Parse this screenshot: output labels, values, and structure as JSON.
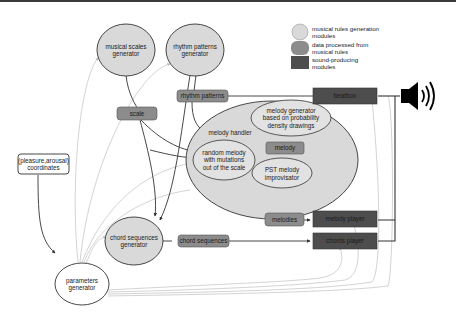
{
  "colors": {
    "module_fill": "#d9d9d9",
    "data_fill": "#8c8c8c",
    "sound_fill": "#4d4d4d",
    "stroke": "#333333",
    "faint_line": "#c8c8c8"
  },
  "legend": {
    "items": [
      {
        "label_line1": "musical rules generation",
        "label_line2": "modules",
        "swatch": "light-circle"
      },
      {
        "label_line1": "data processed from",
        "label_line2": "musical rules",
        "swatch": "medium-rounded"
      },
      {
        "label_line1": "sound-producing",
        "label_line2": "modules",
        "swatch": "dark-square"
      }
    ]
  },
  "nodes": {
    "musical_scales_generator": {
      "line1": "musical scales",
      "line2": "generator"
    },
    "rhythm_patterns_generator": {
      "line1": "rhythm patterns",
      "line2": "generator"
    },
    "scale": {
      "label": "scale"
    },
    "rhythm_patterns": {
      "label": "rhythm patterns"
    },
    "beatbox": {
      "label": "beatbox"
    },
    "melody_handler": {
      "label": "melody handler"
    },
    "melody_generator": {
      "line1": "melody generator",
      "line2": "based on probability",
      "line3": "density drawings"
    },
    "random_melody": {
      "line1": "random melody",
      "line2": "with mutations",
      "line3": "out of the scale"
    },
    "melody": {
      "label": "melody"
    },
    "pst_improvisator": {
      "line1": "PST melody",
      "line2": "improvisator"
    },
    "melodies": {
      "label": "melodies"
    },
    "melody_player": {
      "label": "melody player"
    },
    "chord_sequences": {
      "label": "chord sequences"
    },
    "chords_player": {
      "label": "chords player"
    },
    "chord_sequences_generator": {
      "line1": "chord sequences",
      "line2": "generator"
    },
    "pleasure_arousal": {
      "line1": "(pleasure,arousal)",
      "line2": "coordinates"
    },
    "parameters_generator": {
      "line1": "parameters",
      "line2": "generator"
    }
  },
  "icons": {
    "speaker": "speaker-icon"
  }
}
